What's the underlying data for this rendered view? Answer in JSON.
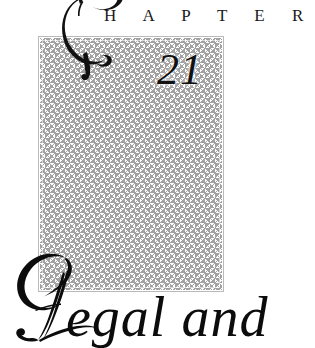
{
  "page": {
    "kind": "book-chapter-opener",
    "background_color": "#ffffff"
  },
  "heading": {
    "drop_cap": "C",
    "drop_cap_icon": "ornate-swash-capital-c",
    "rest_of_word": "H A P T E R",
    "full_word": "CHAPTER",
    "color": "#1a1a1a"
  },
  "chapter_number": {
    "value": "21",
    "color": "#111111"
  },
  "pattern_box": {
    "pattern_name": "houndstooth-pattern",
    "pattern_color": "#9b9b9b",
    "background_color": "#ffffff",
    "border_color": "#b9b9b9"
  },
  "title": {
    "drop_cap": "L",
    "drop_cap_icon": "ornate-swash-capital-l",
    "rest_of_text": "egal and",
    "full_text": "Legal and",
    "color": "#0c0c0c"
  }
}
